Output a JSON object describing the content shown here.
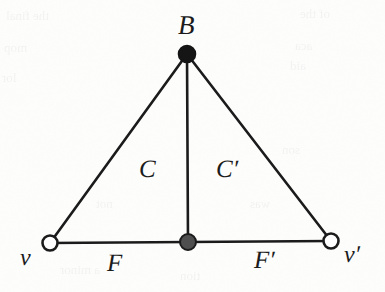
{
  "figure": {
    "type": "graph-diagram",
    "background_color": "#fdfdfc",
    "ink_color": "#1b1b1b",
    "labels": {
      "apex": "B",
      "left_cell": "C",
      "right_cell": "C′",
      "left_base_edge": "F",
      "right_base_edge": "F′",
      "left_vertex": "v",
      "right_vertex": "v′"
    },
    "nodes": [
      {
        "id": "B",
        "label": "B",
        "x": 187,
        "y": 54,
        "radius": 8.5,
        "style": "filled",
        "fill": "#151515",
        "stroke": "#151515"
      },
      {
        "id": "mid",
        "label": "",
        "x": 188,
        "y": 242,
        "radius": 8.0,
        "style": "filled-gray",
        "fill": "#4f4f4f",
        "stroke": "#1b1b1b"
      },
      {
        "id": "v",
        "label": "v",
        "x": 50,
        "y": 243,
        "radius": 7.5,
        "style": "open",
        "fill": "#ffffff",
        "stroke": "#1b1b1b"
      },
      {
        "id": "v_prime",
        "label": "v′",
        "x": 331,
        "y": 241,
        "radius": 7.5,
        "style": "open",
        "fill": "#ffffff",
        "stroke": "#1b1b1b"
      }
    ],
    "edges": [
      {
        "id": "B-v",
        "from": "B",
        "to": "v",
        "label": "",
        "width": 2.6
      },
      {
        "id": "B-vprime",
        "from": "B",
        "to": "v_prime",
        "label": "",
        "width": 2.6
      },
      {
        "id": "B-mid",
        "from": "B",
        "to": "mid",
        "label": "",
        "width": 2.6
      },
      {
        "id": "v-mid",
        "from": "v",
        "to": "mid",
        "label": "F",
        "width": 2.6
      },
      {
        "id": "mid-vprime",
        "from": "mid",
        "to": "v_prime",
        "label": "F′",
        "width": 2.6
      }
    ],
    "regions": [
      {
        "id": "C",
        "label": "C",
        "centroid_x": 148,
        "centroid_y": 175
      },
      {
        "id": "C_prime",
        "label": "C′",
        "centroid_x": 228,
        "centroid_y": 175
      }
    ]
  },
  "bleed_through": [
    {
      "text": "the final",
      "x": 6,
      "y": 8,
      "size": 13
    },
    {
      "text": "mop",
      "x": 4,
      "y": 40,
      "size": 13
    },
    {
      "text": "lor",
      "x": 2,
      "y": 70,
      "size": 13
    },
    {
      "text": "of the",
      "x": 300,
      "y": 6,
      "size": 13
    },
    {
      "text": "aca",
      "x": 295,
      "y": 38,
      "size": 13
    },
    {
      "text": "aid",
      "x": 290,
      "y": 58,
      "size": 13
    },
    {
      "text": "son",
      "x": 282,
      "y": 142,
      "size": 13
    },
    {
      "text": "was",
      "x": 250,
      "y": 196,
      "size": 13
    },
    {
      "text": "not",
      "x": 96,
      "y": 196,
      "size": 13
    },
    {
      "text": "a minor",
      "x": 60,
      "y": 262,
      "size": 13
    },
    {
      "text": "tion",
      "x": 180,
      "y": 268,
      "size": 13
    }
  ]
}
